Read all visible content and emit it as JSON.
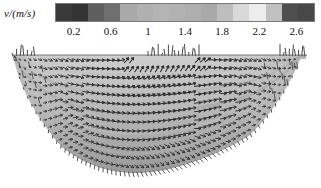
{
  "figure": {
    "background": "#ffffff",
    "width": 321,
    "height": 188
  },
  "colorbar": {
    "axis_label": "v/(m/s)",
    "quantity_symbol": "v",
    "unit": "m/s",
    "orientation": "horizontal",
    "colormap": "grayscale-discrete",
    "range": [
      0.0,
      2.8
    ],
    "tick_values": [
      0.2,
      0.6,
      1,
      1.4,
      1.8,
      2.2,
      2.6
    ],
    "tick_labels": [
      "0.2",
      "0.6",
      "1",
      "1.4",
      "1.8",
      "2.2",
      "2.6"
    ],
    "band_colors": [
      "#3a3a3a",
      "#343434",
      "#5e5e5e",
      "#6f6f6f",
      "#a8a8a8",
      "#b0b0b0",
      "#b4b4b4",
      "#b2b2b2",
      "#aeaeae",
      "#a9a9a9",
      "#bdbdbd",
      "#d8d8d8",
      "#ededed",
      "#c0c0c0",
      "#4e4e4e",
      "#484848"
    ],
    "border_color": "#7a7a7a",
    "text_color": "#111111"
  },
  "chart_data": {
    "type": "heatmap",
    "subtype": "vector-field-quiver-over-filled-cross-section",
    "title": "",
    "xlabel": "",
    "ylabel": "",
    "legend_position": "top",
    "grid": false,
    "colorbar_label": "v/(m/s)",
    "colorbar_ticks": [
      0.2,
      0.6,
      1,
      1.4,
      1.8,
      2.2,
      2.6
    ],
    "value_range": [
      0.0,
      2.8
    ],
    "domain_description": "trapezoidal river channel cross-section with curved bed",
    "domain_outline": [
      [
        12,
        11
      ],
      [
        307,
        11
      ],
      [
        300,
        58
      ],
      [
        276,
        88
      ],
      [
        215,
        118
      ],
      [
        150,
        124
      ],
      [
        92,
        112
      ],
      [
        58,
        84
      ],
      [
        30,
        48
      ],
      [
        12,
        11
      ]
    ],
    "free_surface_y": 11,
    "n_vector_columns": 58,
    "n_vector_rows": 13,
    "vector_color": "#2d2d2d",
    "fill_colors": [
      "#c9c9c9",
      "#b5b5b5",
      "#9f9f9f",
      "#8d8d8d"
    ],
    "series": [
      {
        "name": "streamwise velocity magnitude",
        "values": [
          0.25,
          0.45,
          0.7,
          1.0,
          1.3,
          1.55,
          1.75,
          1.9,
          2.05,
          2.15,
          2.25,
          2.3,
          2.35,
          2.38,
          2.4,
          2.38,
          2.34,
          2.28,
          2.2,
          2.1,
          1.95,
          1.78,
          1.55,
          1.25,
          0.95,
          0.65,
          0.4,
          0.22
        ]
      }
    ],
    "x": [
      0.0,
      0.036,
      0.071,
      0.107,
      0.143,
      0.179,
      0.214,
      0.25,
      0.286,
      0.321,
      0.357,
      0.393,
      0.429,
      0.464,
      0.5,
      0.536,
      0.571,
      0.607,
      0.643,
      0.679,
      0.714,
      0.75,
      0.786,
      0.821,
      0.857,
      0.893,
      0.929,
      1.0
    ]
  }
}
